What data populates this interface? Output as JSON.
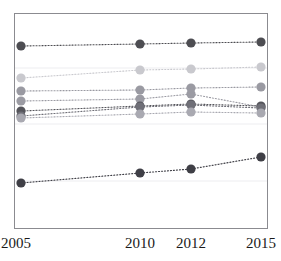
{
  "chart_data": {
    "type": "line",
    "title": "",
    "subtitle": "",
    "xlabel": "",
    "ylabel": "",
    "x": [
      2005,
      2010,
      2012,
      2015
    ],
    "categories": [
      "2005",
      "2010",
      "2012",
      "2015"
    ],
    "tick_labels": [
      "2005",
      "2010",
      "2012",
      "2015"
    ],
    "grid": false,
    "legend": "none",
    "legend_position": "none",
    "axis_range_y_pixels": [
      13,
      228
    ],
    "marker": "circle",
    "line_style": "dotted",
    "series": [
      {
        "name": "series-1",
        "color": "#4d4d52",
        "values": [
          46,
          44,
          43,
          42
        ],
        "y_pixels": [
          46,
          44,
          43,
          42
        ]
      },
      {
        "name": "series-2",
        "color": "#c9c9ce",
        "values": [
          78,
          70,
          69,
          67
        ],
        "y_pixels": [
          78,
          70,
          69,
          67
        ]
      },
      {
        "name": "series-3",
        "color": "#9a9aa2",
        "values": [
          91,
          90,
          88,
          87
        ],
        "y_pixels": [
          91,
          90,
          88,
          87
        ]
      },
      {
        "name": "series-4",
        "color": "#9b9ba3",
        "values": [
          101,
          99,
          94,
          107
        ],
        "y_pixels": [
          101,
          99,
          94,
          107
        ]
      },
      {
        "name": "series-5",
        "color": "#55555b",
        "values": [
          111,
          106,
          104,
          106
        ],
        "y_pixels": [
          111,
          106,
          104,
          106
        ]
      },
      {
        "name": "series-6",
        "color": "#6f6f77",
        "values": [
          116,
          107,
          105,
          108
        ],
        "y_pixels": [
          116,
          107,
          105,
          108
        ]
      },
      {
        "name": "series-7",
        "color": "#a9a9b1",
        "values": [
          118,
          114,
          112,
          113
        ],
        "y_pixels": [
          118,
          114,
          112,
          113
        ]
      },
      {
        "name": "series-8",
        "color": "#3f3f46",
        "values": [
          183,
          173,
          169,
          157
        ],
        "y_pixels": [
          183,
          173,
          169,
          157
        ]
      }
    ],
    "gridlines_y_pixels": [
      68,
      124,
      181
    ],
    "colors": {
      "axis": "#8b8b90",
      "gridline": "#ededf0",
      "background": "#ffffff",
      "text": "#1a1a1a"
    }
  },
  "axis": {
    "x_ticks": [
      {
        "label": "2005",
        "x_pixel": 21
      },
      {
        "label": "2010",
        "x_pixel": 140
      },
      {
        "label": "2012",
        "x_pixel": 191
      },
      {
        "label": "2015",
        "x_pixel": 261
      }
    ]
  }
}
